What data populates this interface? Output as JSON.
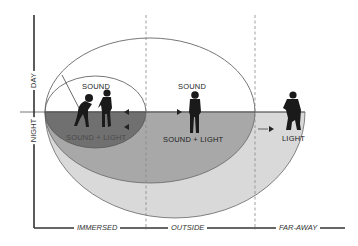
{
  "diagram": {
    "vertical_axis": {
      "top_label": "DAY",
      "bottom_label": "NIGHT"
    },
    "horizontal_axis": {
      "labels": [
        "IMMERSED",
        "OUTSIDE",
        "FAR-AWAY"
      ]
    },
    "zones": [
      {
        "name": "inner",
        "day_label": "SOUND",
        "night_label": "SOUND + LIGHT",
        "fill": "#6f6f6f"
      },
      {
        "name": "middle",
        "day_label": "SOUND",
        "night_label": "SOUND + LIGHT",
        "fill": "#a6a6a6"
      },
      {
        "name": "outer",
        "night_label": "LIGHT",
        "fill": "#d6d6d6"
      }
    ],
    "figures": [
      {
        "name": "figure-immersed-bent",
        "zone": "inner"
      },
      {
        "name": "figure-immersed-standing",
        "zone": "inner"
      },
      {
        "name": "figure-outside-standing",
        "zone": "middle"
      },
      {
        "name": "figure-far-away",
        "zone": "outer"
      }
    ],
    "colors": {
      "line": "#555555",
      "axis": "#333333",
      "dark": "#6f6f6f",
      "mid": "#a6a6a6",
      "light": "#d6d6d6"
    }
  }
}
